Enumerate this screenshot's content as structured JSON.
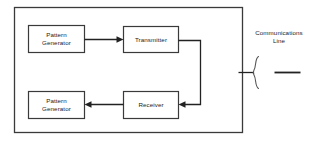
{
  "diagram": {
    "stroke_color": "#3a3a3a",
    "text_color": "#1a1a1a",
    "background_color": "#ffffff",
    "outer_frame": {
      "name": "test-set-enclosure"
    },
    "nodes": [
      {
        "id": "pattern-generator-tx",
        "line1": "Pattern",
        "line2": "Generator"
      },
      {
        "id": "transmitter",
        "line1": "Transmitter",
        "line2": ""
      },
      {
        "id": "receiver",
        "line1": "Receiver",
        "line2": ""
      },
      {
        "id": "pattern-generator-rx",
        "line1": "Pattern",
        "line2": "Generator"
      }
    ],
    "annotations": {
      "comm_line_line1": "Communications",
      "comm_line_line2": "Line"
    }
  }
}
